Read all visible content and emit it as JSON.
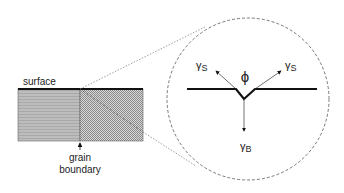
{
  "diagram": {
    "labels": {
      "surface": "surface",
      "grain_boundary_line1": "grain",
      "grain_boundary_line2": "boundary",
      "angle": "ϕ",
      "gamma_s_left_main": "γ",
      "gamma_s_left_sub": "S",
      "gamma_s_right_main": "γ",
      "gamma_s_right_sub": "S",
      "gamma_b_main": "γ",
      "gamma_b_sub": "B"
    },
    "colors": {
      "line": "#111111",
      "left_grain_fill": "#b3b3b3",
      "right_grain_fill": "#a8a8a8",
      "dashed": "#666666"
    }
  }
}
